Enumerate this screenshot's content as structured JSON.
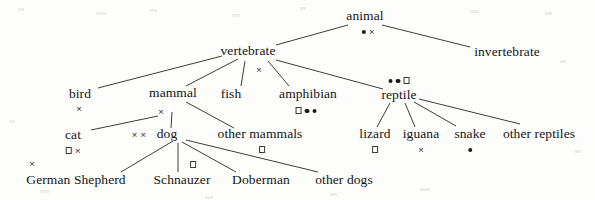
{
  "figure": {
    "type": "tree-diagram",
    "width": 595,
    "height": 200,
    "background_color": "#fdfdfc",
    "text_color": "#141414",
    "edge_color": "#3d3d3d"
  },
  "marker_legend": {
    "dot": "filled-circle",
    "square": "open-square",
    "cross": "cross-times"
  },
  "nodes": [
    {
      "id": "animal",
      "label": "animal",
      "x": 365,
      "y": 16,
      "markers": [
        "dot",
        "cross"
      ],
      "marker_x": 368,
      "marker_y": 31,
      "marker_align": "below"
    },
    {
      "id": "invertebrate",
      "label": "invertebrate",
      "x": 507,
      "y": 52,
      "markers": [],
      "marker_x": 507,
      "marker_y": 66,
      "marker_align": "below"
    },
    {
      "id": "vertebrate",
      "label": "vertebrate",
      "x": 248,
      "y": 51,
      "markers": [
        "cross"
      ],
      "marker_x": 259,
      "marker_y": 69,
      "marker_align": "below"
    },
    {
      "id": "bird",
      "label": "bird",
      "x": 80,
      "y": 94,
      "markers": [
        "cross"
      ],
      "marker_x": 79,
      "marker_y": 108,
      "marker_align": "below"
    },
    {
      "id": "mammal",
      "label": "mammal",
      "x": 173,
      "y": 93,
      "markers": [
        "cross"
      ],
      "marker_x": 161,
      "marker_y": 111,
      "marker_align": "below"
    },
    {
      "id": "fish",
      "label": "fish",
      "x": 231,
      "y": 94,
      "markers": [],
      "marker_x": 231,
      "marker_y": 108,
      "marker_align": "below"
    },
    {
      "id": "amphibian",
      "label": "amphibian",
      "x": 308,
      "y": 94,
      "markers": [
        "square",
        "dot",
        "dot"
      ],
      "marker_x": 306,
      "marker_y": 110,
      "marker_align": "below"
    },
    {
      "id": "reptile",
      "label": "reptile",
      "x": 399,
      "y": 95,
      "markers": [
        "dot",
        "dot",
        "square"
      ],
      "marker_x": 399,
      "marker_y": 80,
      "marker_align": "above"
    },
    {
      "id": "cat",
      "label": "cat",
      "x": 73,
      "y": 135,
      "markers": [
        "square",
        "cross"
      ],
      "marker_x": 73,
      "marker_y": 150,
      "marker_align": "below"
    },
    {
      "id": "dog",
      "label": "dog",
      "x": 167,
      "y": 134,
      "markers": [
        "cross",
        "cross"
      ],
      "marker_x": 139,
      "marker_y": 134,
      "marker_align": "left"
    },
    {
      "id": "other_mammals",
      "label": "other mammals",
      "x": 260,
      "y": 134,
      "markers": [
        "square"
      ],
      "marker_x": 262,
      "marker_y": 149,
      "marker_align": "below"
    },
    {
      "id": "lizard",
      "label": "lizard",
      "x": 375,
      "y": 134,
      "markers": [
        "square"
      ],
      "marker_x": 375,
      "marker_y": 149,
      "marker_align": "below"
    },
    {
      "id": "iguana",
      "label": "iguana",
      "x": 421,
      "y": 134,
      "markers": [
        "cross"
      ],
      "marker_x": 421,
      "marker_y": 149,
      "marker_align": "below"
    },
    {
      "id": "snake",
      "label": "snake",
      "x": 470,
      "y": 134,
      "markers": [
        "dot"
      ],
      "marker_x": 470,
      "marker_y": 149,
      "marker_align": "below"
    },
    {
      "id": "other_reptiles",
      "label": "other reptiles",
      "x": 539,
      "y": 134,
      "markers": [],
      "marker_x": 539,
      "marker_y": 149,
      "marker_align": "below"
    },
    {
      "id": "german_shepherd",
      "label": "German Shepherd",
      "x": 76,
      "y": 180,
      "markers": [
        "cross"
      ],
      "marker_x": 32,
      "marker_y": 163,
      "marker_align": "above-left"
    },
    {
      "id": "schnauzer",
      "label": "Schnauzer",
      "x": 182,
      "y": 180,
      "markers": [
        "square"
      ],
      "marker_x": 193,
      "marker_y": 164,
      "marker_align": "above"
    },
    {
      "id": "doberman",
      "label": "Doberman",
      "x": 261,
      "y": 180,
      "markers": [],
      "marker_x": 261,
      "marker_y": 164,
      "marker_align": "above"
    },
    {
      "id": "other_dogs",
      "label": "other dogs",
      "x": 344,
      "y": 180,
      "markers": [],
      "marker_x": 344,
      "marker_y": 164,
      "marker_align": "above"
    }
  ],
  "edges": [
    {
      "from": "animal",
      "to": "vertebrate",
      "x1": 348,
      "y1": 25,
      "x2": 276,
      "y2": 45
    },
    {
      "from": "animal",
      "to": "invertebrate",
      "x1": 382,
      "y1": 25,
      "x2": 470,
      "y2": 47
    },
    {
      "from": "vertebrate",
      "to": "bird",
      "x1": 222,
      "y1": 56,
      "x2": 98,
      "y2": 88
    },
    {
      "from": "vertebrate",
      "to": "mammal",
      "x1": 238,
      "y1": 59,
      "x2": 186,
      "y2": 86
    },
    {
      "from": "vertebrate",
      "to": "fish",
      "x1": 245,
      "y1": 61,
      "x2": 241,
      "y2": 86
    },
    {
      "from": "vertebrate",
      "to": "amphibian",
      "x1": 268,
      "y1": 61,
      "x2": 289,
      "y2": 86
    },
    {
      "from": "vertebrate",
      "to": "reptile",
      "x1": 276,
      "y1": 60,
      "x2": 383,
      "y2": 89
    },
    {
      "from": "mammal",
      "to": "cat",
      "x1": 158,
      "y1": 116,
      "x2": 91,
      "y2": 130
    },
    {
      "from": "mammal",
      "to": "dog",
      "x1": 172,
      "y1": 112,
      "x2": 171,
      "y2": 128
    },
    {
      "from": "mammal",
      "to": "other_mammals",
      "x1": 186,
      "y1": 102,
      "x2": 234,
      "y2": 128
    },
    {
      "from": "dog",
      "to": "german_shepherd",
      "x1": 173,
      "y1": 141,
      "x2": 121,
      "y2": 172
    },
    {
      "from": "dog",
      "to": "schnauzer",
      "x1": 178,
      "y1": 143,
      "x2": 178,
      "y2": 172
    },
    {
      "from": "dog",
      "to": "doberman",
      "x1": 182,
      "y1": 142,
      "x2": 236,
      "y2": 172
    },
    {
      "from": "dog",
      "to": "other_dogs",
      "x1": 186,
      "y1": 140,
      "x2": 318,
      "y2": 172
    },
    {
      "from": "reptile",
      "to": "lizard",
      "x1": 390,
      "y1": 103,
      "x2": 377,
      "y2": 127
    },
    {
      "from": "reptile",
      "to": "iguana",
      "x1": 405,
      "y1": 103,
      "x2": 415,
      "y2": 127
    },
    {
      "from": "reptile",
      "to": "snake",
      "x1": 414,
      "y1": 102,
      "x2": 456,
      "y2": 126
    },
    {
      "from": "reptile",
      "to": "other_reptiles",
      "x1": 419,
      "y1": 99,
      "x2": 520,
      "y2": 124
    }
  ]
}
